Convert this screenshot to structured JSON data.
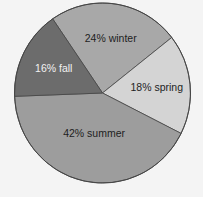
{
  "chart_data": {
    "type": "pie",
    "title": "",
    "categories": [
      "winter",
      "spring",
      "summer",
      "fall"
    ],
    "values": [
      24,
      18,
      42,
      16
    ],
    "unit": "%",
    "labels": [
      "24% winter",
      "18% spring",
      "42% summer",
      "16% fall"
    ],
    "colors": [
      "#a8a8a8",
      "#d4d4d4",
      "#9d9d9d",
      "#6c6c6c"
    ],
    "label_colors": [
      "#1e1e1e",
      "#1e1e1e",
      "#1e1e1e",
      "#f2f2f2"
    ],
    "legend": "none"
  },
  "geometry": {
    "cx": 102.5,
    "cy": 93,
    "rx": 88,
    "ry": 90,
    "outline_color": "#454545",
    "background": "#f4f4f4"
  }
}
